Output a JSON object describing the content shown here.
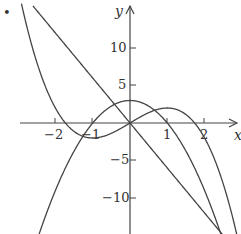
{
  "chart_data": {
    "type": "line",
    "title": "",
    "xlabel": "x",
    "ylabel": "y",
    "xlim": [
      -3.5,
      3
    ],
    "ylim": [
      -15,
      16
    ],
    "grid": false,
    "legend": "none",
    "x_ticks": [
      -2,
      -1,
      1,
      2
    ],
    "x_tick_labels": [
      "−2",
      "−1",
      "1",
      "2"
    ],
    "y_ticks": [
      10,
      5,
      -5,
      -10
    ],
    "y_tick_labels": [
      "10",
      "5",
      "−5",
      "−10"
    ],
    "series": [
      {
        "name": "f(x) = -x^3 + 3x",
        "kind": "cubic",
        "x": [
          -2.5,
          -2,
          -1.73,
          -1,
          0,
          1,
          1.73,
          2,
          2.5
        ],
        "y": [
          8.1,
          2,
          0,
          -2,
          0,
          2,
          0,
          -2,
          -8.1
        ]
      },
      {
        "name": "f'(x) = 3 - 3x^2",
        "kind": "parabola",
        "x": [
          -2.5,
          -2,
          -1,
          0,
          1,
          2,
          2.5
        ],
        "y": [
          -15.75,
          -9,
          0,
          3,
          0,
          -9,
          -15.75
        ]
      },
      {
        "name": "f''(x) = -6x",
        "kind": "line",
        "x": [
          -2.5,
          0,
          2.5
        ],
        "y": [
          15,
          0,
          -15
        ]
      }
    ],
    "annotations": [
      "•"
    ]
  },
  "labels": {
    "x_axis": "x",
    "y_axis": "y",
    "bullet": "•",
    "ticks_x": [
      "−2",
      "−1",
      "1",
      "2"
    ],
    "ticks_y": [
      "10",
      "5",
      "−5",
      "−10"
    ]
  }
}
